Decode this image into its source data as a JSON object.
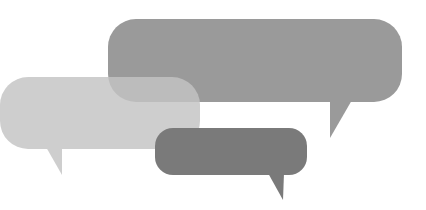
{
  "illustration": {
    "description": "Three overlapping speech bubbles in shades of gray",
    "background": "#ffffff",
    "bubbles": [
      {
        "name": "large-speech-bubble",
        "color": "#9a9a9a",
        "opacity": 1
      },
      {
        "name": "light-speech-bubble",
        "color": "#c8c8c8",
        "opacity": 0.85
      },
      {
        "name": "dark-speech-bubble",
        "color": "#7a7a7a",
        "opacity": 1
      }
    ]
  }
}
